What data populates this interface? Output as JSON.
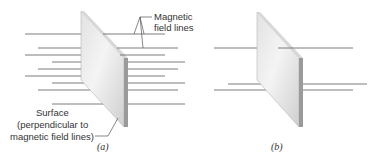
{
  "figure": {
    "panels": [
      {
        "id": "a",
        "caption": "(a)",
        "field_line_count": 9,
        "labels": {
          "field_lines_line1": "Magnetic",
          "field_lines_line2": "field lines",
          "surface_line1": "Surface",
          "surface_line2": "(perpendicular to",
          "surface_line3": "magnetic field lines)"
        }
      },
      {
        "id": "b",
        "caption": "(b)",
        "field_line_count": 3
      }
    ],
    "colors": {
      "field_line": "#6e6e6e",
      "arrow": "#707070",
      "plate_light": "#f2f2f2",
      "plate_dark": "#c9c9c9",
      "plate_edge": "#9a9a9a",
      "text": "#333333"
    }
  }
}
